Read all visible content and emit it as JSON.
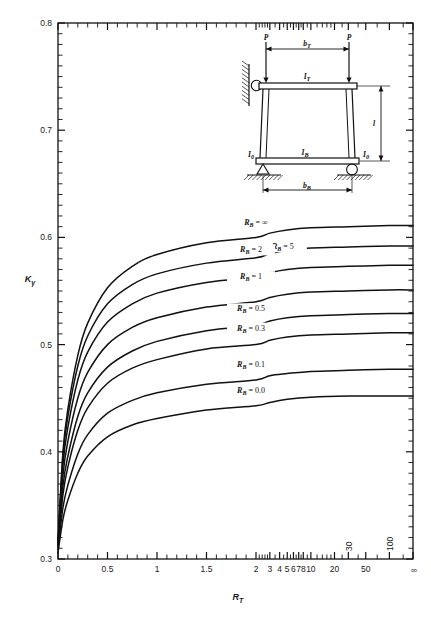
{
  "chart_data": {
    "type": "line",
    "title": "",
    "xlabel": "R_T",
    "ylabel": "K_gamma",
    "ylim": [
      0.3,
      0.8
    ],
    "grid": false,
    "legend_position": "inline-on-curves",
    "x_tick_labels": [
      "0",
      "0.5",
      "1",
      "1.5",
      "2",
      "3",
      "4",
      "5",
      "6",
      "7",
      "8",
      "10",
      "20",
      "30",
      "50",
      "100",
      "∞"
    ],
    "y_tick_labels": [
      "0.3",
      "0.4",
      "0.5",
      "0.6",
      "0.7",
      "0.8"
    ],
    "y_major_step": 0.1,
    "y_minor_step": 0.01,
    "x_scale_note": "linear 0-2 then compressed log-like 2 to infinity",
    "series": [
      {
        "name": "R_B = ∞",
        "label": "R_B = ∞",
        "x": [
          0.0,
          0.05,
          0.1,
          0.2,
          0.3,
          0.5,
          0.75,
          1.0,
          1.5,
          2.0,
          3.0,
          5.0,
          10.0,
          30.0,
          100.0,
          1000.0
        ],
        "y": [
          0.315,
          0.4,
          0.44,
          0.49,
          0.52,
          0.553,
          0.573,
          0.584,
          0.595,
          0.6,
          0.604,
          0.607,
          0.609,
          0.61,
          0.611,
          0.611
        ]
      },
      {
        "name": "R_B = 5",
        "label": "R_B = 5",
        "x": [
          0.0,
          0.05,
          0.1,
          0.2,
          0.3,
          0.5,
          0.75,
          1.0,
          1.5,
          2.0,
          3.0,
          5.0,
          10.0,
          30.0,
          100.0,
          1000.0
        ],
        "y": [
          0.315,
          0.395,
          0.433,
          0.48,
          0.508,
          0.538,
          0.556,
          0.566,
          0.576,
          0.581,
          0.585,
          0.588,
          0.59,
          0.591,
          0.592,
          0.592
        ]
      },
      {
        "name": "R_B = 2",
        "label": "R_B = 2",
        "x": [
          0.0,
          0.05,
          0.1,
          0.2,
          0.3,
          0.5,
          0.75,
          1.0,
          1.5,
          2.0,
          3.0,
          5.0,
          10.0,
          30.0,
          100.0,
          1000.0
        ],
        "y": [
          0.315,
          0.388,
          0.423,
          0.467,
          0.493,
          0.521,
          0.538,
          0.548,
          0.558,
          0.563,
          0.567,
          0.57,
          0.572,
          0.573,
          0.574,
          0.574
        ]
      },
      {
        "name": "R_B = 1",
        "label": "R_B = 1",
        "x": [
          0.0,
          0.05,
          0.1,
          0.2,
          0.3,
          0.5,
          0.75,
          1.0,
          1.5,
          2.0,
          3.0,
          5.0,
          10.0,
          30.0,
          100.0,
          1000.0
        ],
        "y": [
          0.313,
          0.378,
          0.41,
          0.45,
          0.474,
          0.5,
          0.516,
          0.525,
          0.535,
          0.54,
          0.544,
          0.547,
          0.549,
          0.55,
          0.551,
          0.551
        ]
      },
      {
        "name": "R_B = 0.5",
        "label": "R_B = 0.5",
        "x": [
          0.0,
          0.05,
          0.1,
          0.2,
          0.3,
          0.5,
          0.75,
          1.0,
          1.5,
          2.0,
          3.0,
          5.0,
          10.0,
          30.0,
          100.0,
          1000.0
        ],
        "y": [
          0.312,
          0.368,
          0.396,
          0.433,
          0.455,
          0.479,
          0.494,
          0.503,
          0.513,
          0.518,
          0.522,
          0.525,
          0.527,
          0.528,
          0.529,
          0.529
        ]
      },
      {
        "name": "R_B = 0.3",
        "label": "R_B = 0.3",
        "x": [
          0.0,
          0.05,
          0.1,
          0.2,
          0.3,
          0.5,
          0.75,
          1.0,
          1.5,
          2.0,
          3.0,
          5.0,
          10.0,
          30.0,
          100.0,
          1000.0
        ],
        "y": [
          0.311,
          0.36,
          0.386,
          0.42,
          0.441,
          0.464,
          0.478,
          0.486,
          0.496,
          0.5,
          0.504,
          0.507,
          0.509,
          0.51,
          0.511,
          0.511
        ]
      },
      {
        "name": "R_B = 0.1",
        "label": "R_B = 0.1",
        "x": [
          0.0,
          0.05,
          0.1,
          0.2,
          0.3,
          0.5,
          0.75,
          1.0,
          1.5,
          2.0,
          3.0,
          5.0,
          10.0,
          30.0,
          100.0,
          1000.0
        ],
        "y": [
          0.309,
          0.348,
          0.369,
          0.398,
          0.416,
          0.436,
          0.448,
          0.455,
          0.463,
          0.467,
          0.471,
          0.473,
          0.475,
          0.476,
          0.477,
          0.477
        ]
      },
      {
        "name": "R_B = 0.0",
        "label": "R_B = 0.0",
        "x": [
          0.0,
          0.05,
          0.1,
          0.2,
          0.3,
          0.5,
          0.75,
          1.0,
          1.5,
          2.0,
          3.0,
          5.0,
          10.0,
          30.0,
          100.0,
          1000.0
        ],
        "y": [
          0.306,
          0.337,
          0.355,
          0.38,
          0.396,
          0.414,
          0.425,
          0.431,
          0.439,
          0.443,
          0.446,
          0.449,
          0.451,
          0.452,
          0.452,
          0.452
        ]
      }
    ],
    "curve_labels": [
      {
        "text": "R_B = ∞",
        "base": "R",
        "sub": "B",
        "rest": " = ∞",
        "x": 2.0,
        "y": 0.612
      },
      {
        "text": "R_B = 5",
        "base": "R",
        "sub": "B",
        "rest": " = 5",
        "x": 4.4,
        "y": 0.589
      },
      {
        "text": "R_B = 2",
        "base": "R",
        "sub": "B",
        "rest": " = 2",
        "x": 1.95,
        "y": 0.586
      },
      {
        "text": "R_B = 1",
        "base": "R",
        "sub": "B",
        "rest": " = 1",
        "x": 1.95,
        "y": 0.561
      },
      {
        "text": "R_B = 0.5",
        "base": "R",
        "sub": "B",
        "rest": " = 0.5",
        "x": 1.95,
        "y": 0.531
      },
      {
        "text": "R_B = 0.3",
        "base": "R",
        "sub": "B",
        "rest": " = 0.3",
        "x": 1.95,
        "y": 0.513
      },
      {
        "text": "R_B = 0.1",
        "base": "R",
        "sub": "B",
        "rest": " = 0.1",
        "x": 1.95,
        "y": 0.479
      },
      {
        "text": "R_B = 0.0",
        "base": "R",
        "sub": "B",
        "rest": " = 0.0",
        "x": 1.95,
        "y": 0.455
      }
    ],
    "colors": {
      "curve": "#111111",
      "axis": "#111111",
      "background": "#ffffff"
    }
  },
  "axes": {
    "y_axis_label_base": "K",
    "y_axis_label_sub": "γ",
    "x_axis_label_base": "R",
    "x_axis_label_sub": "T"
  },
  "diagram": {
    "labels": {
      "load_left": "P",
      "load_right": "P",
      "top_width": "b",
      "top_width_sub": "T",
      "top_beam": "I",
      "top_beam_sub": "T",
      "bottom_beam": "I",
      "bottom_beam_sub": "B",
      "column_left": "I",
      "column_left_sub": "0",
      "column_right": "I",
      "column_right_sub": "0",
      "height": "l",
      "bottom_width": "b",
      "bottom_width_sub": "B"
    }
  }
}
